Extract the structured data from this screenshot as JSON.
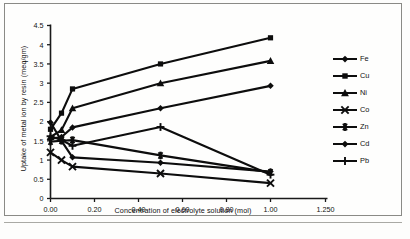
{
  "chart_data": {
    "type": "line",
    "title": "",
    "xlabel": "Concentration of electrolyte solution (mol)",
    "ylabel": "Uptake of metal ion by resin (meq/gm)",
    "xlim": [
      0,
      1.25
    ],
    "ylim": [
      0,
      4.5
    ],
    "xticks": [
      0,
      0.2,
      0.4,
      0.6,
      0.8,
      1.0,
      1.25
    ],
    "xtick_labels": [
      "0.00",
      "0.20",
      "0.40",
      "0.60",
      "0.80",
      "1.00",
      "1.250"
    ],
    "yticks": [
      0,
      0.5,
      1,
      1.5,
      2,
      2.5,
      3,
      3.5,
      4,
      4.5
    ],
    "ytick_labels": [
      "0",
      "0.5",
      "1",
      "1.5",
      "2",
      "2.5",
      "3",
      "3.5",
      "4",
      "4.5"
    ],
    "grid": false,
    "legend_position": "right",
    "x": [
      0,
      0.05,
      0.1,
      0.5,
      1.0
    ],
    "series": [
      {
        "name": "Fe",
        "marker": "diamond",
        "values": [
          1.55,
          1.6,
          1.85,
          2.35,
          2.93
        ]
      },
      {
        "name": "Cu",
        "marker": "square",
        "values": [
          1.8,
          2.22,
          2.85,
          3.5,
          4.18
        ]
      },
      {
        "name": "Ni",
        "marker": "triangle",
        "values": [
          1.6,
          1.78,
          2.35,
          3.0,
          3.58
        ]
      },
      {
        "name": "Co",
        "marker": "cross",
        "values": [
          1.2,
          1.0,
          0.83,
          0.65,
          0.4
        ]
      },
      {
        "name": "Zn",
        "marker": "asterisk",
        "values": [
          1.48,
          1.5,
          1.52,
          1.12,
          0.68
        ]
      },
      {
        "name": "Cd",
        "marker": "dot-diamond",
        "values": [
          1.98,
          1.5,
          1.07,
          0.93,
          0.7
        ]
      },
      {
        "name": "Pb",
        "marker": "plus",
        "values": [
          1.62,
          1.52,
          1.37,
          1.86,
          0.62
        ]
      }
    ]
  },
  "legend": {
    "items": [
      {
        "label": "Fe"
      },
      {
        "label": "Cu"
      },
      {
        "label": "Ni"
      },
      {
        "label": "Co"
      },
      {
        "label": "Zn"
      },
      {
        "label": "Cd"
      },
      {
        "label": "Pb"
      }
    ]
  },
  "colors": {
    "ink": "#0d0d0d",
    "axis": "#1a1a1a",
    "page": "#fdfdfc",
    "frame": "#8a8a86"
  }
}
